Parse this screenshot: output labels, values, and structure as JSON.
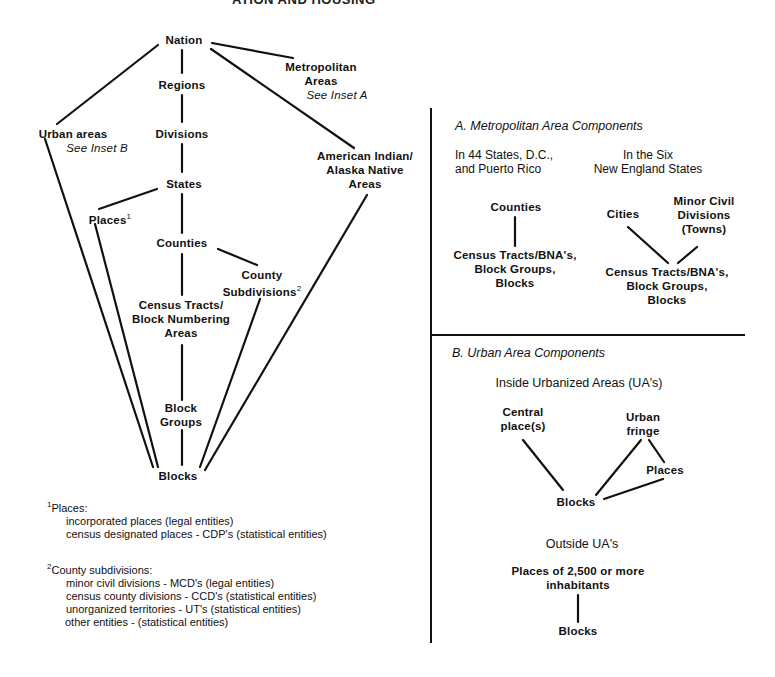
{
  "header": {
    "title": "ATION AND HOUSING"
  },
  "main_diagram": {
    "nodes": {
      "nation": "Nation",
      "metro_line1": "Metropolitan",
      "metro_line2": "Areas",
      "metro_ref": "See Inset A",
      "regions": "Regions",
      "divisions": "Divisions",
      "urban_areas": "Urban areas",
      "urban_ref": "See Inset B",
      "aian_line1": "American Indian/",
      "aian_line2": "Alaska Native",
      "aian_line3": "Areas",
      "states": "States",
      "places": "Places",
      "places_sup": "1",
      "counties": "Counties",
      "county_sub_line1": "County",
      "county_sub_line2": "Subdivisions",
      "county_sub_sup": "2",
      "tracts_line1": "Census Tracts/",
      "tracts_line2": "Block Numbering",
      "tracts_line3": "Areas",
      "block_groups_line1": "Block",
      "block_groups_line2": "Groups",
      "blocks": "Blocks"
    }
  },
  "footnotes": {
    "places": {
      "marker": "1",
      "title": "Places:",
      "items": [
        "incorporated places (legal entities)",
        "census designated places - CDP's (statistical entities)"
      ]
    },
    "county_subdivisions": {
      "marker": "2",
      "title": "County subdivisions:",
      "items": [
        "minor civil divisions - MCD's (legal entities)",
        "census county divisions - CCD's (statistical entities)",
        "unorganized territories - UT's (statistical entities)",
        "other entities - (statistical entities)"
      ]
    }
  },
  "inset_a": {
    "title": "A. Metropolitan Area Components",
    "left_heading_line1": "In 44 States, D.C.,",
    "left_heading_line2": "and Puerto Rico",
    "right_heading_line1": "In the Six",
    "right_heading_line2": "New England States",
    "left": {
      "counties": "Counties",
      "bottom_line1": "Census Tracts/BNA's,",
      "bottom_line2": "Block Groups,",
      "bottom_line3": "Blocks"
    },
    "right": {
      "cities": "Cities",
      "mcd_line1": "Minor Civil",
      "mcd_line2": "Divisions",
      "mcd_line3": "(Towns)",
      "bottom_line1": "Census Tracts/BNA's,",
      "bottom_line2": "Block Groups,",
      "bottom_line3": "Blocks"
    }
  },
  "inset_b": {
    "title": "B. Urban Area Components",
    "inside_heading": "Inside Urbanized Areas (UA's)",
    "central_line1": "Central",
    "central_line2": "place(s)",
    "fringe_line1": "Urban",
    "fringe_line2": "fringe",
    "places": "Places",
    "blocks": "Blocks",
    "outside_heading": "Outside UA's",
    "places_2500_line1": "Places of 2,500 or more",
    "places_2500_line2": "inhabitants",
    "outside_blocks": "Blocks"
  }
}
